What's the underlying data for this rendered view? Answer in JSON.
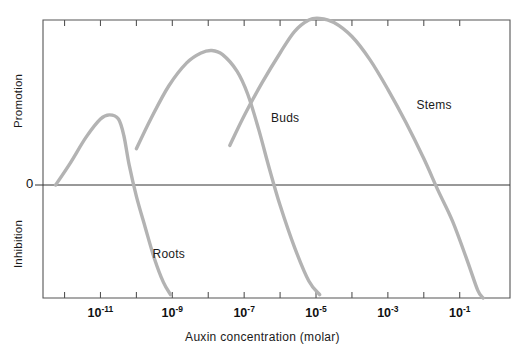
{
  "chart_data": {
    "type": "line",
    "title": "",
    "xlabel": "Auxin concentration (molar)",
    "ylabel_top": "Promotion",
    "ylabel_bottom": "Inhibition",
    "zero_label": "0",
    "grid": false,
    "legend_position": "inline-annotations",
    "x_scale": "log10",
    "xlim": [
      -12.6,
      0.4
    ],
    "ylim": [
      -1.0,
      1.0
    ],
    "x_tick_exponents": [
      -12,
      -11,
      -10,
      -9,
      -8,
      -7,
      -6,
      -5,
      -4,
      -3,
      -2,
      -1
    ],
    "x_tick_labels": [
      {
        "exponent": "-11",
        "mantissa": "10",
        "x_log": -11
      },
      {
        "exponent": "-9",
        "mantissa": "10",
        "x_log": -9
      },
      {
        "exponent": "-7",
        "mantissa": "10",
        "x_log": -7
      },
      {
        "exponent": "-5",
        "mantissa": "10",
        "x_log": -5
      },
      {
        "exponent": "-3",
        "mantissa": "10",
        "x_log": -3
      },
      {
        "exponent": "-1",
        "mantissa": "10",
        "x_log": -1
      }
    ],
    "curve_color": "#b3b3b3",
    "axis_color": "#555555",
    "series": [
      {
        "name": "Roots",
        "label": "Roots",
        "label_x_log": -9.55,
        "label_y": -0.62,
        "points": [
          {
            "x_log": -12.25,
            "y": 0.0
          },
          {
            "x_log": -11.85,
            "y": 0.13
          },
          {
            "x_log": -11.4,
            "y": 0.29
          },
          {
            "x_log": -11.0,
            "y": 0.4
          },
          {
            "x_log": -10.75,
            "y": 0.425
          },
          {
            "x_log": -10.5,
            "y": 0.4
          },
          {
            "x_log": -10.35,
            "y": 0.3
          },
          {
            "x_log": -10.2,
            "y": 0.12
          },
          {
            "x_log": -10.0,
            "y": -0.1
          },
          {
            "x_log": -9.75,
            "y": -0.38
          },
          {
            "x_log": -9.5,
            "y": -0.65
          },
          {
            "x_log": -9.25,
            "y": -0.86
          },
          {
            "x_log": -9.05,
            "y": -0.97
          }
        ]
      },
      {
        "name": "Buds",
        "label": "Buds",
        "label_x_log": -6.25,
        "label_y": 0.4,
        "points": [
          {
            "x_log": -10.0,
            "y": 0.22
          },
          {
            "x_log": -9.6,
            "y": 0.4
          },
          {
            "x_log": -9.1,
            "y": 0.6
          },
          {
            "x_log": -8.6,
            "y": 0.74
          },
          {
            "x_log": -8.2,
            "y": 0.8
          },
          {
            "x_log": -7.9,
            "y": 0.815
          },
          {
            "x_log": -7.6,
            "y": 0.79
          },
          {
            "x_log": -7.2,
            "y": 0.69
          },
          {
            "x_log": -6.9,
            "y": 0.55
          },
          {
            "x_log": -6.6,
            "y": 0.34
          },
          {
            "x_log": -6.3,
            "y": 0.1
          },
          {
            "x_log": -6.0,
            "y": -0.18
          },
          {
            "x_log": -5.6,
            "y": -0.55
          },
          {
            "x_log": -5.2,
            "y": -0.85
          },
          {
            "x_log": -4.9,
            "y": -0.97
          }
        ]
      },
      {
        "name": "Stems",
        "label": "Stems",
        "label_x_log": -2.2,
        "label_y": 0.48,
        "points": [
          {
            "x_log": -7.4,
            "y": 0.24
          },
          {
            "x_log": -7.0,
            "y": 0.42
          },
          {
            "x_log": -6.5,
            "y": 0.62
          },
          {
            "x_log": -6.0,
            "y": 0.8
          },
          {
            "x_log": -5.6,
            "y": 0.93
          },
          {
            "x_log": -5.2,
            "y": 1.0
          },
          {
            "x_log": -4.9,
            "y": 1.01
          },
          {
            "x_log": -4.5,
            "y": 0.985
          },
          {
            "x_log": -4.0,
            "y": 0.9
          },
          {
            "x_log": -3.5,
            "y": 0.76
          },
          {
            "x_log": -3.0,
            "y": 0.58
          },
          {
            "x_log": -2.5,
            "y": 0.38
          },
          {
            "x_log": -2.0,
            "y": 0.16
          },
          {
            "x_log": -1.6,
            "y": -0.05
          },
          {
            "x_log": -1.2,
            "y": -0.32
          },
          {
            "x_log": -0.8,
            "y": -0.66
          },
          {
            "x_log": -0.5,
            "y": -0.93
          },
          {
            "x_log": -0.35,
            "y": -1.0
          }
        ]
      }
    ]
  }
}
